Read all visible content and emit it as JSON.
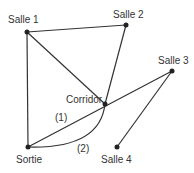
{
  "nodes": [
    {
      "id": "salle1",
      "label": "Salle 1",
      "x": 27,
      "y": 32,
      "lx": 8,
      "ly": 15
    },
    {
      "id": "salle2",
      "label": "Salle 2",
      "x": 126,
      "y": 25,
      "lx": 113,
      "ly": 10
    },
    {
      "id": "salle3",
      "label": "Salle 3",
      "x": 172,
      "y": 71,
      "lx": 158,
      "ly": 56
    },
    {
      "id": "corridor",
      "label": "Corridor",
      "x": 105,
      "y": 104,
      "lx": 66,
      "ly": 95
    },
    {
      "id": "sortie",
      "label": "Sortie",
      "x": 28,
      "y": 147,
      "lx": 16,
      "ly": 155
    },
    {
      "id": "salle4",
      "label": "Salle 4",
      "x": 117,
      "y": 147,
      "lx": 101,
      "ly": 155
    }
  ],
  "edges": [
    {
      "from": "salle1",
      "to": "salle2"
    },
    {
      "from": "salle1",
      "to": "sortie"
    },
    {
      "from": "salle1",
      "to": "corridor"
    },
    {
      "from": "salle2",
      "to": "corridor"
    },
    {
      "from": "sortie",
      "to": "salle3",
      "label": "(1)"
    },
    {
      "from": "salle3",
      "to": "salle4"
    },
    {
      "from": "sortie",
      "to": "corridor",
      "curved": true,
      "label": "(2)"
    }
  ],
  "edge_labels": [
    {
      "text": "(1)",
      "x": 55,
      "y": 113
    },
    {
      "text": "(2)",
      "x": 77,
      "y": 144
    }
  ],
  "colors": {
    "line": "#333333",
    "node": "#222222",
    "text": "#333333"
  }
}
